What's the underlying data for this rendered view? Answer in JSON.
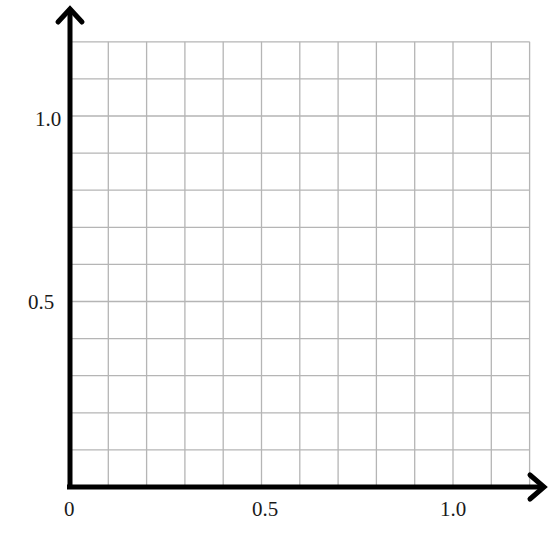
{
  "chart_data": {
    "type": "scatter",
    "title": "",
    "xlabel": "",
    "ylabel": "",
    "x": [],
    "y": [],
    "series": [],
    "xlim": [
      0,
      1.2
    ],
    "ylim": [
      0,
      1.2
    ],
    "grid": true,
    "grid_step": 0.1,
    "legend": null,
    "x_ticks": [
      {
        "value": 0,
        "label": "0"
      },
      {
        "value": 0.5,
        "label": "0.5"
      },
      {
        "value": 1.0,
        "label": "1.0"
      }
    ],
    "y_ticks": [
      {
        "value": 0.5,
        "label": "0.5"
      },
      {
        "value": 1.0,
        "label": "1.0"
      }
    ],
    "axes_arrows": true
  },
  "colors": {
    "grid": "#b5b5b5",
    "axis": "#000000",
    "background": "#ffffff",
    "text": "#1a1a1a"
  }
}
